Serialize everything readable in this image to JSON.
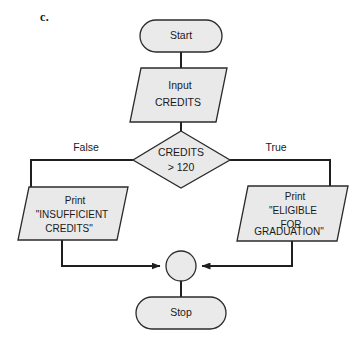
{
  "figure": {
    "part_label": "c.",
    "colors": {
      "shape_fill": "#e9e9e9",
      "shape_stroke": "#2b2b2b",
      "connector": "#1f1f1f",
      "background": "#ffffff",
      "text": "#1a1a1a"
    }
  },
  "nodes": {
    "start": {
      "type": "terminator",
      "label": "Start"
    },
    "input": {
      "type": "input-output",
      "line1": "Input",
      "line2": "CREDITS"
    },
    "decision": {
      "type": "decision",
      "line1": "CREDITS",
      "line2": "> 120"
    },
    "print_false": {
      "type": "input-output",
      "line1": "Print",
      "line2": "\"INSUFFICIENT",
      "line3": "CREDITS\""
    },
    "print_true": {
      "type": "input-output",
      "line1": "Print",
      "line2": "\"ELIGIBLE",
      "line3": "FOR",
      "line4": "GRADUATION\""
    },
    "merge": {
      "type": "connector-circle",
      "label": ""
    },
    "stop": {
      "type": "terminator",
      "label": "Stop"
    }
  },
  "branches": {
    "false_label": "False",
    "true_label": "True"
  }
}
